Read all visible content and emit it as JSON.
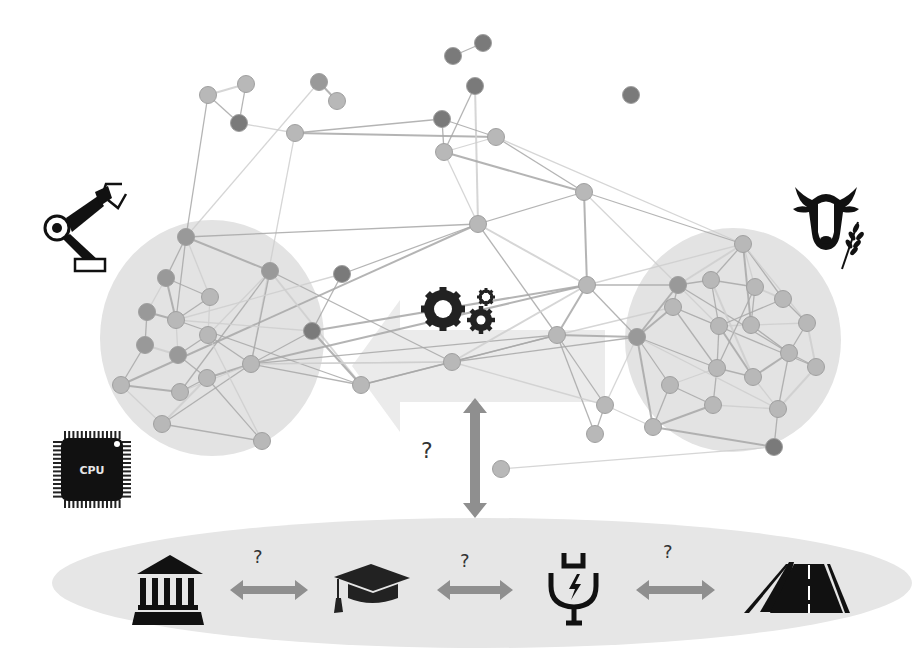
{
  "diagram": {
    "colors": {
      "background": "#ffffff",
      "cluster_fill": "#e3e3e3",
      "ellipse_fill": "#e6e6e6",
      "big_arrow_fill": "#e9e9e9",
      "node_light": "#b8b8b8",
      "node_mid": "#999999",
      "node_dark": "#7a7a7a",
      "edge": "#a8a8a8",
      "edge_light": "#cfcfcf",
      "double_arrow": "#8f8f8f",
      "icon": "#111111"
    },
    "clusters": [
      {
        "id": "left-cluster",
        "cx": 212,
        "cy": 338,
        "rx": 112,
        "ry": 118
      },
      {
        "id": "right-cluster",
        "cx": 733,
        "cy": 340,
        "rx": 108,
        "ry": 112
      }
    ],
    "central_arrow": {
      "direction": "left",
      "shaft": {
        "x": 400,
        "y": 330,
        "w": 205,
        "h": 72
      },
      "head_tip_x": 352,
      "head_top": 300,
      "head_bottom": 432
    },
    "top_icons": [
      {
        "name": "robot-arm-icon",
        "x": 45,
        "y": 180
      },
      {
        "name": "cow-wheat-icon",
        "x": 785,
        "y": 180
      },
      {
        "name": "cpu-chip-icon",
        "x": 48,
        "y": 428,
        "label": "CPU"
      },
      {
        "name": "gears-icon",
        "x": 415,
        "y": 283
      }
    ],
    "vertical_arrow": {
      "x": 475,
      "y1": 398,
      "y2": 518
    },
    "center_question": "?",
    "bottom_row": {
      "ellipse": {
        "cx": 482,
        "cy": 583,
        "rx": 430,
        "ry": 65
      },
      "items": [
        {
          "name": "bank-institution-icon",
          "label": "institution"
        },
        {
          "name": "graduation-cap-icon",
          "label": "education"
        },
        {
          "name": "ev-plug-icon",
          "label": "energy"
        },
        {
          "name": "road-icon",
          "label": "infrastructure"
        }
      ],
      "links": [
        {
          "question": "?",
          "x1": 230,
          "x2": 308,
          "y": 590,
          "qx": 255,
          "qy": 548
        },
        {
          "question": "?",
          "x1": 437,
          "x2": 513,
          "y": 590,
          "qx": 462,
          "qy": 553
        },
        {
          "question": "?",
          "x1": 636,
          "x2": 715,
          "y": 590,
          "qx": 665,
          "qy": 544
        }
      ]
    },
    "nodes": [
      {
        "id": 1,
        "x": 208,
        "y": 95,
        "shade": "light"
      },
      {
        "id": 2,
        "x": 246,
        "y": 84,
        "shade": "light"
      },
      {
        "id": 3,
        "x": 239,
        "y": 123,
        "shade": "dark"
      },
      {
        "id": 4,
        "x": 319,
        "y": 82,
        "shade": "mid"
      },
      {
        "id": 5,
        "x": 337,
        "y": 101,
        "shade": "light"
      },
      {
        "id": 6,
        "x": 295,
        "y": 133,
        "shade": "light"
      },
      {
        "id": 7,
        "x": 453,
        "y": 56,
        "shade": "dark"
      },
      {
        "id": 8,
        "x": 483,
        "y": 43,
        "shade": "dark"
      },
      {
        "id": 9,
        "x": 475,
        "y": 86,
        "shade": "dark"
      },
      {
        "id": 10,
        "x": 442,
        "y": 119,
        "shade": "dark"
      },
      {
        "id": 11,
        "x": 444,
        "y": 152,
        "shade": "light"
      },
      {
        "id": 12,
        "x": 496,
        "y": 137,
        "shade": "light"
      },
      {
        "id": 13,
        "x": 631,
        "y": 95,
        "shade": "dark"
      },
      {
        "id": 14,
        "x": 584,
        "y": 192,
        "shade": "light"
      },
      {
        "id": 15,
        "x": 478,
        "y": 224,
        "shade": "light"
      },
      {
        "id": 16,
        "x": 186,
        "y": 237,
        "shade": "mid"
      },
      {
        "id": 17,
        "x": 270,
        "y": 271,
        "shade": "mid"
      },
      {
        "id": 18,
        "x": 342,
        "y": 274,
        "shade": "dark"
      },
      {
        "id": 19,
        "x": 166,
        "y": 278,
        "shade": "mid"
      },
      {
        "id": 20,
        "x": 210,
        "y": 297,
        "shade": "light"
      },
      {
        "id": 21,
        "x": 147,
        "y": 312,
        "shade": "mid"
      },
      {
        "id": 22,
        "x": 176,
        "y": 320,
        "shade": "light"
      },
      {
        "id": 23,
        "x": 208,
        "y": 335,
        "shade": "light"
      },
      {
        "id": 24,
        "x": 145,
        "y": 345,
        "shade": "mid"
      },
      {
        "id": 25,
        "x": 178,
        "y": 355,
        "shade": "mid"
      },
      {
        "id": 26,
        "x": 312,
        "y": 331,
        "shade": "dark"
      },
      {
        "id": 27,
        "x": 251,
        "y": 364,
        "shade": "light"
      },
      {
        "id": 28,
        "x": 207,
        "y": 378,
        "shade": "light"
      },
      {
        "id": 29,
        "x": 180,
        "y": 392,
        "shade": "light"
      },
      {
        "id": 30,
        "x": 121,
        "y": 385,
        "shade": "light"
      },
      {
        "id": 31,
        "x": 361,
        "y": 385,
        "shade": "light"
      },
      {
        "id": 32,
        "x": 162,
        "y": 424,
        "shade": "light"
      },
      {
        "id": 33,
        "x": 262,
        "y": 441,
        "shade": "light"
      },
      {
        "id": 34,
        "x": 452,
        "y": 362,
        "shade": "light"
      },
      {
        "id": 35,
        "x": 587,
        "y": 285,
        "shade": "light"
      },
      {
        "id": 36,
        "x": 557,
        "y": 335,
        "shade": "light"
      },
      {
        "id": 37,
        "x": 678,
        "y": 285,
        "shade": "mid"
      },
      {
        "id": 38,
        "x": 743,
        "y": 244,
        "shade": "light"
      },
      {
        "id": 39,
        "x": 711,
        "y": 280,
        "shade": "light"
      },
      {
        "id": 40,
        "x": 755,
        "y": 287,
        "shade": "light"
      },
      {
        "id": 41,
        "x": 783,
        "y": 299,
        "shade": "light"
      },
      {
        "id": 42,
        "x": 673,
        "y": 307,
        "shade": "light"
      },
      {
        "id": 43,
        "x": 719,
        "y": 326,
        "shade": "light"
      },
      {
        "id": 44,
        "x": 751,
        "y": 325,
        "shade": "light"
      },
      {
        "id": 45,
        "x": 807,
        "y": 323,
        "shade": "light"
      },
      {
        "id": 46,
        "x": 637,
        "y": 337,
        "shade": "mid"
      },
      {
        "id": 47,
        "x": 717,
        "y": 368,
        "shade": "light"
      },
      {
        "id": 48,
        "x": 753,
        "y": 377,
        "shade": "light"
      },
      {
        "id": 49,
        "x": 789,
        "y": 353,
        "shade": "light"
      },
      {
        "id": 50,
        "x": 816,
        "y": 367,
        "shade": "light"
      },
      {
        "id": 51,
        "x": 670,
        "y": 385,
        "shade": "light"
      },
      {
        "id": 52,
        "x": 713,
        "y": 405,
        "shade": "light"
      },
      {
        "id": 53,
        "x": 778,
        "y": 409,
        "shade": "light"
      },
      {
        "id": 54,
        "x": 605,
        "y": 405,
        "shade": "light"
      },
      {
        "id": 55,
        "x": 653,
        "y": 427,
        "shade": "light"
      },
      {
        "id": 56,
        "x": 595,
        "y": 434,
        "shade": "light"
      },
      {
        "id": 57,
        "x": 774,
        "y": 447,
        "shade": "dark"
      },
      {
        "id": 58,
        "x": 501,
        "y": 469,
        "shade": "light"
      }
    ],
    "edges": [
      [
        1,
        2
      ],
      [
        1,
        3
      ],
      [
        2,
        3
      ],
      [
        3,
        6
      ],
      [
        4,
        5
      ],
      [
        1,
        16
      ],
      [
        4,
        16
      ],
      [
        6,
        10
      ],
      [
        6,
        12
      ],
      [
        6,
        27
      ],
      [
        7,
        8
      ],
      [
        9,
        11
      ],
      [
        9,
        15
      ],
      [
        10,
        11
      ],
      [
        10,
        12
      ],
      [
        11,
        12
      ],
      [
        11,
        14
      ],
      [
        12,
        14
      ],
      [
        12,
        38
      ],
      [
        14,
        15
      ],
      [
        14,
        35
      ],
      [
        14,
        37
      ],
      [
        14,
        38
      ],
      [
        15,
        18
      ],
      [
        15,
        35
      ],
      [
        15,
        36
      ],
      [
        15,
        16
      ],
      [
        11,
        15
      ],
      [
        15,
        30
      ],
      [
        16,
        19
      ],
      [
        16,
        20
      ],
      [
        16,
        22
      ],
      [
        16,
        17
      ],
      [
        17,
        23
      ],
      [
        17,
        27
      ],
      [
        17,
        29
      ],
      [
        17,
        31
      ],
      [
        17,
        34
      ],
      [
        19,
        20
      ],
      [
        19,
        21
      ],
      [
        19,
        22
      ],
      [
        20,
        22
      ],
      [
        20,
        23
      ],
      [
        21,
        24
      ],
      [
        21,
        22
      ],
      [
        22,
        25
      ],
      [
        23,
        25
      ],
      [
        23,
        27
      ],
      [
        24,
        25
      ],
      [
        25,
        28
      ],
      [
        26,
        27
      ],
      [
        26,
        22
      ],
      [
        27,
        28
      ],
      [
        27,
        31
      ],
      [
        27,
        29
      ],
      [
        28,
        29
      ],
      [
        29,
        30
      ],
      [
        30,
        32
      ],
      [
        30,
        24
      ],
      [
        32,
        33
      ],
      [
        32,
        28
      ],
      [
        32,
        27
      ],
      [
        33,
        28
      ],
      [
        33,
        23
      ],
      [
        31,
        26
      ],
      [
        31,
        22
      ],
      [
        27,
        34
      ],
      [
        27,
        36
      ],
      [
        27,
        35
      ],
      [
        18,
        22
      ],
      [
        18,
        26
      ],
      [
        34,
        36
      ],
      [
        34,
        35
      ],
      [
        34,
        46
      ],
      [
        34,
        31
      ],
      [
        34,
        27
      ],
      [
        35,
        36
      ],
      [
        35,
        37
      ],
      [
        35,
        38
      ],
      [
        36,
        54
      ],
      [
        36,
        46
      ],
      [
        36,
        42
      ],
      [
        36,
        56
      ],
      [
        35,
        46
      ],
      [
        37,
        38
      ],
      [
        37,
        39
      ],
      [
        37,
        42
      ],
      [
        37,
        43
      ],
      [
        37,
        46
      ],
      [
        38,
        39
      ],
      [
        38,
        40
      ],
      [
        38,
        41
      ],
      [
        38,
        44
      ],
      [
        38,
        45
      ],
      [
        39,
        40
      ],
      [
        39,
        43
      ],
      [
        40,
        41
      ],
      [
        40,
        44
      ],
      [
        41,
        45
      ],
      [
        42,
        43
      ],
      [
        42,
        46
      ],
      [
        42,
        47
      ],
      [
        43,
        44
      ],
      [
        43,
        47
      ],
      [
        43,
        48
      ],
      [
        44,
        45
      ],
      [
        44,
        49
      ],
      [
        45,
        49
      ],
      [
        45,
        50
      ],
      [
        46,
        47
      ],
      [
        46,
        51
      ],
      [
        46,
        54
      ],
      [
        46,
        55
      ],
      [
        47,
        48
      ],
      [
        47,
        51
      ],
      [
        47,
        52
      ],
      [
        48,
        49
      ],
      [
        48,
        53
      ],
      [
        49,
        50
      ],
      [
        49,
        53
      ],
      [
        50,
        53
      ],
      [
        51,
        52
      ],
      [
        51,
        55
      ],
      [
        52,
        53
      ],
      [
        52,
        55
      ],
      [
        53,
        57
      ],
      [
        54,
        55
      ],
      [
        54,
        56
      ],
      [
        55,
        57
      ],
      [
        46,
        53
      ],
      [
        42,
        50
      ],
      [
        37,
        49
      ],
      [
        39,
        48
      ],
      [
        40,
        47
      ],
      [
        41,
        43
      ],
      [
        58,
        57
      ],
      [
        26,
        35
      ],
      [
        31,
        36
      ],
      [
        34,
        54
      ]
    ]
  }
}
